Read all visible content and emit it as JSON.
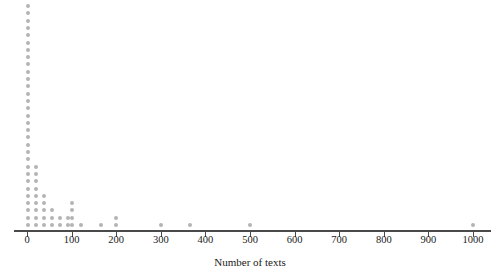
{
  "chart_data": {
    "type": "scatter",
    "plot_style": "dot-plot",
    "title": "",
    "subtitle": "",
    "xlabel": "Number of texts",
    "ylabel": "",
    "xlim": [
      -30,
      1040
    ],
    "grid": false,
    "legend": null,
    "annotations": [],
    "dot_color": "#b4b4b4",
    "axis_color": "#4a4a4a",
    "text_color": "#1a1a1a",
    "xticks": [
      0,
      100,
      200,
      300,
      400,
      500,
      600,
      700,
      800,
      900,
      1000
    ],
    "xticklabels": [
      "0",
      "100",
      "200",
      "300",
      "400",
      "500",
      "600",
      "700",
      "800",
      "900",
      "1000"
    ],
    "stacks": [
      {
        "value": 2,
        "count": 31
      },
      {
        "value": 20,
        "count": 9
      },
      {
        "value": 38,
        "count": 5
      },
      {
        "value": 56,
        "count": 3
      },
      {
        "value": 74,
        "count": 2
      },
      {
        "value": 92,
        "count": 2
      },
      {
        "value": 102,
        "count": 4
      },
      {
        "value": 120,
        "count": 1
      },
      {
        "value": 165,
        "count": 1
      },
      {
        "value": 200,
        "count": 2
      },
      {
        "value": 300,
        "count": 1
      },
      {
        "value": 365,
        "count": 1
      },
      {
        "value": 500,
        "count": 1
      },
      {
        "value": 1000,
        "count": 1
      }
    ]
  },
  "geometry": {
    "x_zero_px": 27,
    "x_max_px": 473,
    "axis_y_px": 230,
    "dot_pitch_px": 7.3,
    "dot_size_px": 4,
    "tick_length_px": 5,
    "baseline_offset_px": 3,
    "axis_label_x_px": 250,
    "axis_label_y_px": 256,
    "tick_label_y_px": 234
  }
}
